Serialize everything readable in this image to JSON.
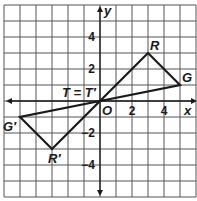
{
  "diagram": {
    "type": "coordinate-plane",
    "grid": {
      "x_min": -6,
      "x_max": 6,
      "y_min": -6,
      "y_max": 6,
      "spacing_px": 16,
      "origin_px": [
        100,
        101
      ],
      "left_px": 4,
      "top_px": 5
    },
    "axes": {
      "x_label": "x",
      "y_label": "y",
      "origin_label": "O"
    },
    "x_ticks": [
      {
        "value": 2,
        "label": "2"
      },
      {
        "value": 4,
        "label": "4"
      }
    ],
    "y_ticks": [
      {
        "value": 4,
        "label": "4"
      },
      {
        "value": 2,
        "label": "2"
      },
      {
        "value": -2,
        "label": "−2"
      },
      {
        "value": -4,
        "label": "−4"
      }
    ],
    "points": {
      "R": {
        "label": "R",
        "x": 3,
        "y": 3
      },
      "G": {
        "label": "G",
        "x": 5,
        "y": 1
      },
      "T": {
        "label": "T = T′",
        "x": 0,
        "y": 0
      },
      "G_prime": {
        "label": "G′",
        "x": -5,
        "y": -1
      },
      "R_prime": {
        "label": "R′",
        "x": -3,
        "y": -3
      }
    },
    "triangles": [
      {
        "name": "TRG",
        "vertices": [
          "T",
          "R",
          "G"
        ]
      },
      {
        "name": "T'R'G'",
        "vertices": [
          "T",
          "R_prime",
          "G_prime"
        ]
      }
    ],
    "colors": {
      "grid": "#555555",
      "lines": "#1a1a1a",
      "background": "#ffffff"
    }
  }
}
